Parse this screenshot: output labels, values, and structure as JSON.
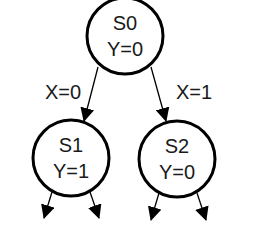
{
  "diagram": {
    "type": "state-machine-tree",
    "colors": {
      "stroke": "#000000",
      "text": "#1a1a1a",
      "background": "#ffffff"
    },
    "states": [
      {
        "id": "S0",
        "name": "S0",
        "output": "Y=0",
        "cx": 125,
        "cy": 36,
        "r": 38
      },
      {
        "id": "S1",
        "name": "S1",
        "output": "Y=1",
        "cx": 71,
        "cy": 158,
        "r": 38
      },
      {
        "id": "S2",
        "name": "S2",
        "output": "Y=0",
        "cx": 177,
        "cy": 159,
        "r": 38
      }
    ],
    "transitions": [
      {
        "from": "S0",
        "to": "S1",
        "label": "X=0"
      },
      {
        "from": "S0",
        "to": "S2",
        "label": "X=1"
      }
    ],
    "outgoing_stubs": [
      {
        "from": "S1",
        "direction": "down-left"
      },
      {
        "from": "S1",
        "direction": "down-right"
      },
      {
        "from": "S2",
        "direction": "down-left"
      },
      {
        "from": "S2",
        "direction": "down-right"
      }
    ]
  }
}
